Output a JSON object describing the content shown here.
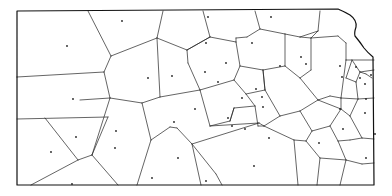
{
  "diagram": {
    "type": "voronoi",
    "region": "Kansas state outline",
    "colors": {
      "background": "#ffffff",
      "lines": "#222222",
      "border": "#111111",
      "sites": "#222222"
    },
    "border_path": "M17,11 L338,9 Q345,12 350,15 Q357,20 356,27 Q354,33 355,36 Q360,42 364,48 Q368,53 373,57 L374,185 L17,185 Z",
    "edges": [
      [
        88,
        11,
        111,
        56
      ],
      [
        163,
        11,
        157,
        38
      ],
      [
        157,
        38,
        111,
        56
      ],
      [
        111,
        56,
        104,
        72
      ],
      [
        104,
        72,
        17,
        77
      ],
      [
        104,
        72,
        110,
        98
      ],
      [
        110,
        98,
        80,
        100
      ],
      [
        110,
        98,
        92,
        155
      ],
      [
        17,
        119,
        108,
        117
      ],
      [
        45,
        118,
        78,
        160
      ],
      [
        78,
        160,
        92,
        155
      ],
      [
        78,
        160,
        31,
        185
      ],
      [
        92,
        155,
        118,
        185
      ],
      [
        92,
        155,
        108,
        117
      ],
      [
        157,
        38,
        160,
        97
      ],
      [
        157,
        38,
        187,
        50
      ],
      [
        187,
        50,
        188,
        63
      ],
      [
        188,
        63,
        200,
        90
      ],
      [
        200,
        90,
        160,
        97
      ],
      [
        160,
        97,
        142,
        103
      ],
      [
        142,
        103,
        110,
        98
      ],
      [
        142,
        103,
        151,
        140
      ],
      [
        151,
        140,
        137,
        185
      ],
      [
        151,
        140,
        170,
        127
      ],
      [
        170,
        127,
        177,
        128
      ],
      [
        177,
        128,
        192,
        144
      ],
      [
        192,
        144,
        216,
        174
      ],
      [
        216,
        174,
        222,
        185
      ],
      [
        192,
        144,
        201,
        185
      ],
      [
        192,
        144,
        259,
        123
      ],
      [
        259,
        123,
        264,
        126
      ],
      [
        203,
        11,
        210,
        37
      ],
      [
        210,
        37,
        187,
        50
      ],
      [
        210,
        37,
        236,
        42
      ],
      [
        236,
        42,
        236,
        38
      ],
      [
        236,
        38,
        247,
        37
      ],
      [
        247,
        37,
        260,
        29
      ],
      [
        260,
        29,
        255,
        11
      ],
      [
        260,
        29,
        285,
        34
      ],
      [
        285,
        34,
        300,
        37
      ],
      [
        300,
        37,
        318,
        31
      ],
      [
        318,
        31,
        320,
        11
      ],
      [
        236,
        42,
        240,
        66
      ],
      [
        240,
        66,
        234,
        80
      ],
      [
        234,
        80,
        200,
        90
      ],
      [
        234,
        80,
        246,
        94
      ],
      [
        246,
        94,
        265,
        90
      ],
      [
        265,
        90,
        263,
        70
      ],
      [
        263,
        70,
        240,
        66
      ],
      [
        263,
        70,
        285,
        66
      ],
      [
        285,
        66,
        285,
        34
      ],
      [
        263,
        70,
        265,
        90
      ],
      [
        285,
        66,
        300,
        78
      ],
      [
        300,
        78,
        311,
        70
      ],
      [
        311,
        70,
        311,
        38
      ],
      [
        300,
        37,
        311,
        38
      ],
      [
        311,
        38,
        338,
        36
      ],
      [
        338,
        36,
        346,
        43
      ],
      [
        246,
        94,
        255,
        106
      ],
      [
        255,
        106,
        258,
        126
      ],
      [
        258,
        126,
        264,
        126
      ],
      [
        264,
        126,
        294,
        140
      ],
      [
        294,
        140,
        298,
        185
      ],
      [
        264,
        126,
        280,
        116
      ],
      [
        280,
        116,
        300,
        111
      ],
      [
        300,
        111,
        318,
        100
      ],
      [
        318,
        100,
        300,
        78
      ],
      [
        318,
        100,
        330,
        96
      ],
      [
        330,
        96,
        341,
        98
      ],
      [
        341,
        98,
        341,
        109
      ],
      [
        341,
        109,
        318,
        100
      ],
      [
        265,
        90,
        280,
        116
      ],
      [
        255,
        106,
        234,
        108
      ],
      [
        234,
        108,
        230,
        121
      ],
      [
        230,
        121,
        210,
        126
      ],
      [
        210,
        126,
        200,
        90
      ],
      [
        210,
        126,
        259,
        123
      ],
      [
        234,
        108,
        230,
        121
      ],
      [
        300,
        111,
        312,
        131
      ],
      [
        312,
        131,
        306,
        141
      ],
      [
        306,
        141,
        294,
        140
      ],
      [
        312,
        131,
        330,
        126
      ],
      [
        330,
        126,
        341,
        109
      ],
      [
        330,
        126,
        338,
        141
      ],
      [
        338,
        141,
        350,
        140
      ],
      [
        350,
        140,
        362,
        138
      ],
      [
        362,
        138,
        374,
        139
      ],
      [
        338,
        141,
        346,
        160
      ],
      [
        346,
        160,
        340,
        185
      ],
      [
        346,
        160,
        362,
        164
      ],
      [
        362,
        164,
        374,
        163
      ],
      [
        306,
        141,
        320,
        158
      ],
      [
        320,
        158,
        346,
        160
      ],
      [
        320,
        158,
        317,
        185
      ],
      [
        341,
        98,
        358,
        99
      ],
      [
        358,
        99,
        374,
        98
      ],
      [
        358,
        99,
        350,
        116
      ],
      [
        350,
        116,
        341,
        109
      ],
      [
        350,
        116,
        362,
        138
      ],
      [
        346,
        43,
        346,
        60
      ],
      [
        346,
        60,
        341,
        98
      ],
      [
        346,
        60,
        374,
        60
      ],
      [
        352,
        60,
        360,
        72
      ],
      [
        360,
        72,
        374,
        70
      ],
      [
        360,
        72,
        356,
        82
      ],
      [
        356,
        82,
        358,
        99
      ],
      [
        356,
        82,
        346,
        78
      ],
      [
        360,
        72,
        366,
        74
      ],
      [
        366,
        74,
        372,
        78
      ],
      [
        352,
        60,
        346,
        78
      ],
      [
        318,
        31,
        311,
        38
      ],
      [
        187,
        50,
        210,
        37
      ],
      [
        17,
        77,
        17,
        77
      ]
    ],
    "sites": [
      [
        67,
        46
      ],
      [
        122,
        21
      ],
      [
        148,
        78
      ],
      [
        172,
        76
      ],
      [
        73,
        99
      ],
      [
        76,
        137
      ],
      [
        116,
        131
      ],
      [
        51,
        152
      ],
      [
        115,
        148
      ],
      [
        178,
        158
      ],
      [
        72,
        184
      ],
      [
        208,
        17
      ],
      [
        271,
        17
      ],
      [
        206,
        43
      ],
      [
        252,
        43
      ],
      [
        226,
        63
      ],
      [
        280,
        66
      ],
      [
        306,
        64
      ],
      [
        205,
        72
      ],
      [
        218,
        82
      ],
      [
        242,
        98
      ],
      [
        262,
        97
      ],
      [
        195,
        109
      ],
      [
        228,
        118
      ],
      [
        232,
        126
      ],
      [
        245,
        129
      ],
      [
        269,
        138
      ],
      [
        254,
        166
      ],
      [
        319,
        143
      ],
      [
        343,
        129
      ],
      [
        340,
        109
      ],
      [
        375,
        134
      ],
      [
        365,
        113
      ],
      [
        366,
        158
      ],
      [
        301,
        57
      ],
      [
        256,
        89
      ],
      [
        263,
        107
      ],
      [
        174,
        122
      ],
      [
        152,
        178
      ],
      [
        340,
        66
      ],
      [
        356,
        67
      ],
      [
        360,
        78
      ],
      [
        342,
        77
      ],
      [
        365,
        84
      ],
      [
        371,
        75
      ],
      [
        366,
        99
      ],
      [
        206,
        181
      ]
    ]
  }
}
